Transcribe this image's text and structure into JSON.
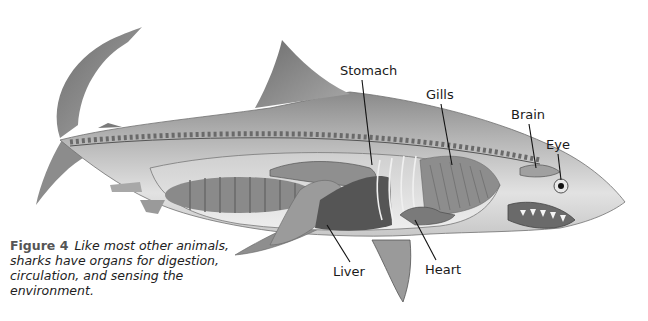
{
  "figure": {
    "number_label": "Figure 4",
    "caption": "Like most other animals, sharks have organs for digestion, circulation, and sensing the environment."
  },
  "labels": [
    {
      "id": "stomach",
      "text": "Stomach",
      "x": 340,
      "y": 63
    },
    {
      "id": "gills",
      "text": "Gills",
      "x": 426,
      "y": 87
    },
    {
      "id": "brain",
      "text": "Brain",
      "x": 511,
      "y": 107
    },
    {
      "id": "eye",
      "text": "Eye",
      "x": 546,
      "y": 137
    },
    {
      "id": "liver",
      "text": "Liver",
      "x": 333,
      "y": 264
    },
    {
      "id": "heart",
      "text": "Heart",
      "x": 425,
      "y": 262
    }
  ],
  "colors": {
    "body": "#9a9a9a",
    "body_light": "#d9d9d9",
    "body_dark": "#5e5e5e",
    "organ": "#7c7c7c",
    "liver": "#505050",
    "leader_line": "#111111"
  }
}
